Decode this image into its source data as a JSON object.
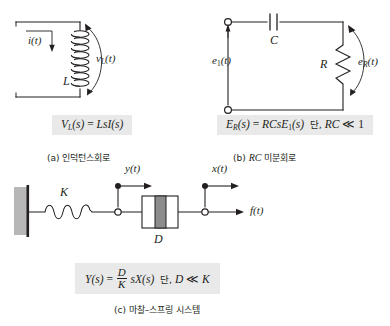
{
  "figure": {
    "panels": [
      {
        "id": "a",
        "caption": "(a) 인덕턴스회로",
        "caption_prefix": "(a)",
        "caption_text": "인덕턴스회로",
        "formula_plain": "V_L(s) = LsI(s)",
        "formula": {
          "lhs_main": "V",
          "lhs_sub": "L",
          "lhs_arg": "(s)",
          "eq": "=",
          "rhs": "LsI(s)"
        },
        "labels": {
          "current": "i(t)",
          "inductor": "L",
          "voltage_main": "v",
          "voltage_sub": "L",
          "voltage_arg": "(t)"
        }
      },
      {
        "id": "b",
        "caption": "(b) RC 미분회로",
        "caption_prefix": "(b)",
        "caption_italic": "RC",
        "caption_text": "미분회로",
        "formula_plain": "E_R(s) = RCsE_1(s) 단, RC ≪ 1",
        "formula": {
          "lhs_main": "E",
          "lhs_sub": "R",
          "lhs_arg": "(s)",
          "eq": "=",
          "rhs_main": "RCsE",
          "rhs_sub": "1",
          "rhs_arg": "(s)",
          "condition_ko": "단,",
          "condition_math": "RC",
          "condition_rel": "≪",
          "condition_val": "1"
        },
        "labels": {
          "source_main": "e",
          "source_sub": "1",
          "source_arg": "(t)",
          "capacitor": "C",
          "resistor": "R",
          "out_main": "e",
          "out_sub": "R",
          "out_arg": "(t)"
        }
      },
      {
        "id": "c",
        "caption": "(c) 마찰–스프링 시스템",
        "caption_prefix": "(c)",
        "caption_text": "마찰–스프링 시스템",
        "formula_plain": "Y(s) = (D/K) sX(s) 단, D ≪ K",
        "formula": {
          "lhs": "Y(s)",
          "eq": "=",
          "frac_num": "D",
          "frac_den": "K",
          "rhs": "sX(s)",
          "condition_ko": "단,",
          "condition_num": "D",
          "condition_rel": "≪",
          "condition_den": "K"
        },
        "labels": {
          "spring": "K",
          "damper": "D",
          "disp_y": "y(t)",
          "disp_x": "x(t)",
          "force": "f(t)"
        }
      }
    ]
  },
  "colors": {
    "ink": "#231f20",
    "formula_bg": "#e9e9e9",
    "wall_fill": "#b7b7b7",
    "damper_fill": "#8c8c8c"
  }
}
